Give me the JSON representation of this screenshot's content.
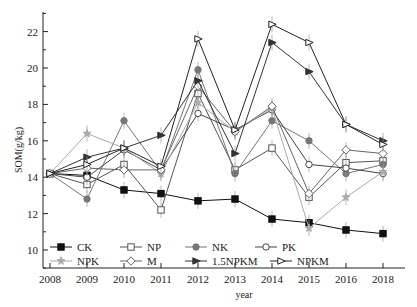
{
  "chart_data": {
    "type": "line",
    "title": "",
    "xlabel": "year",
    "ylabel": "SOM(g/kg)",
    "ylim": [
      9,
      23
    ],
    "yticks": [
      10,
      12,
      14,
      16,
      18,
      20,
      22
    ],
    "categories": [
      "2008",
      "2009",
      "2010",
      "2011",
      "2012",
      "2013",
      "2014",
      "2015",
      "2016",
      "2018"
    ],
    "grid": false,
    "legend_position": "lower-left inside",
    "series": [
      {
        "name": "CK",
        "marker": "square-filled",
        "color": "#111111",
        "values": [
          14.2,
          14.1,
          13.3,
          13.1,
          12.7,
          12.8,
          11.7,
          11.5,
          11.1,
          10.9
        ]
      },
      {
        "name": "NP",
        "marker": "square-open",
        "color": "#555555",
        "values": [
          14.2,
          13.6,
          14.7,
          12.2,
          18.6,
          14.4,
          15.6,
          12.9,
          14.8,
          14.9
        ]
      },
      {
        "name": "NK",
        "marker": "circle-filled",
        "color": "#777777",
        "values": [
          14.2,
          12.8,
          17.1,
          14.3,
          19.9,
          14.2,
          17.1,
          16.0,
          14.2,
          14.7
        ]
      },
      {
        "name": "PK",
        "marker": "circle-open",
        "color": "#444444",
        "values": [
          14.2,
          14.0,
          15.5,
          14.4,
          17.5,
          16.6,
          17.7,
          14.7,
          14.5,
          14.2
        ]
      },
      {
        "name": "NPK",
        "marker": "star-filled",
        "color": "#aaaaaa",
        "values": [
          14.2,
          16.4,
          15.6,
          14.2,
          18.1,
          16.5,
          17.8,
          11.2,
          12.9,
          14.3
        ]
      },
      {
        "name": "M",
        "marker": "diamond-open",
        "color": "#666666",
        "values": [
          14.2,
          14.5,
          14.4,
          14.4,
          19.0,
          16.5,
          17.9,
          13.1,
          15.5,
          15.3
        ]
      },
      {
        "name": "1.5NPKM",
        "marker": "triangle-filled",
        "color": "#333333",
        "values": [
          14.2,
          15.1,
          15.6,
          16.3,
          19.3,
          15.3,
          21.4,
          19.8,
          16.9,
          16.0
        ]
      },
      {
        "name": "NPKM",
        "marker": "triangle-open",
        "color": "#222222",
        "values": [
          14.2,
          14.7,
          15.6,
          14.6,
          21.6,
          16.6,
          22.4,
          21.4,
          16.9,
          15.8
        ]
      }
    ]
  },
  "axes": {
    "xlabel": "year",
    "ylabel": "SOM(g/kg)"
  },
  "legend": {
    "row1": [
      "CK",
      "NP",
      "NK",
      "PK"
    ],
    "row2": [
      "NPK",
      "M",
      "1.5NPKM",
      "NPKM"
    ]
  }
}
